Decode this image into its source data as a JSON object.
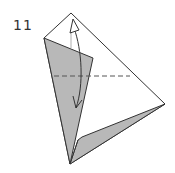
{
  "diagram": {
    "step_number": "11",
    "colors": {
      "paper_white": "#ffffff",
      "paper_gray": "#b8b8b8",
      "line": "#333333",
      "dash": "#555555"
    },
    "elements": [
      {
        "type": "outline",
        "shape": "kite",
        "points": "71,13 44,38 70,164 165,104"
      },
      {
        "type": "gray-flap",
        "points": "44,38 93,58 70,164"
      },
      {
        "type": "gray-lower-flap",
        "points": "70,164 80,138 84,136 165,104"
      },
      {
        "type": "valley-fold-line",
        "style": "dashed",
        "from": [
          54,
          76
        ],
        "to": [
          130,
          76
        ]
      },
      {
        "type": "fold-arrow",
        "direction": "down-and-back-up",
        "from_y": 22,
        "to_y": 110
      }
    ]
  }
}
